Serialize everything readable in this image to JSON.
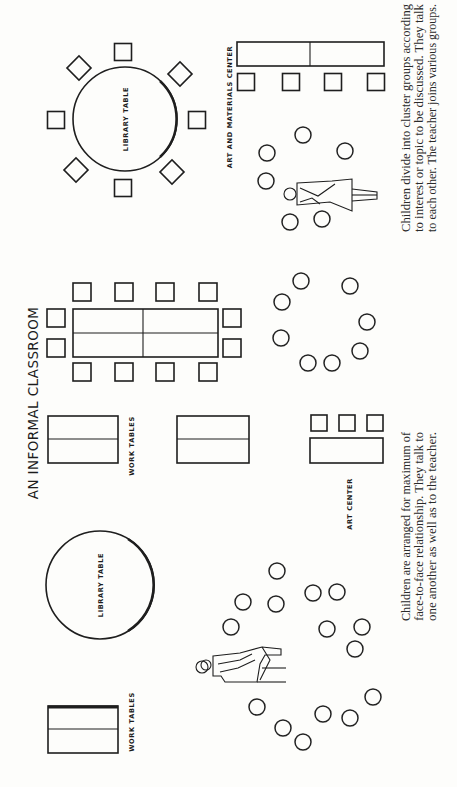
{
  "title": "AN INFORMAL CLASSROOM",
  "colors": {
    "ink": "#1e1e1e",
    "paper": "#fdfdfb"
  },
  "layouts": [
    {
      "id": "formal-cluster",
      "labels": {
        "library_table": "LIBRARY TABLE",
        "art_center": "ART AND MATERIALS CENTER"
      },
      "caption": [
        "Children divide into cluster groups according",
        "to interest or topic to be discussed. They talk",
        "to each other. The teacher joins various groups."
      ]
    },
    {
      "id": "middle",
      "labels": {
        "work_tables": "WORK TABLES",
        "art_center": "ART CENTER"
      }
    },
    {
      "id": "face-to-face",
      "labels": {
        "library_table": "LIBRARY TABLE",
        "work_tables": "WORK TABLES"
      },
      "caption": [
        "Children are arranged for maximum of",
        "face-to-face relationship. They talk to",
        "one another as well as to the teacher."
      ]
    }
  ],
  "counts": {
    "library_table_chairs": 8,
    "art_materials_chairs": 4,
    "group_table_chairs": 12,
    "art_center_chairs": 3,
    "top_cluster_stools": 6,
    "middle_cluster_stools": 8,
    "bottom_cluster_stools": 15
  }
}
